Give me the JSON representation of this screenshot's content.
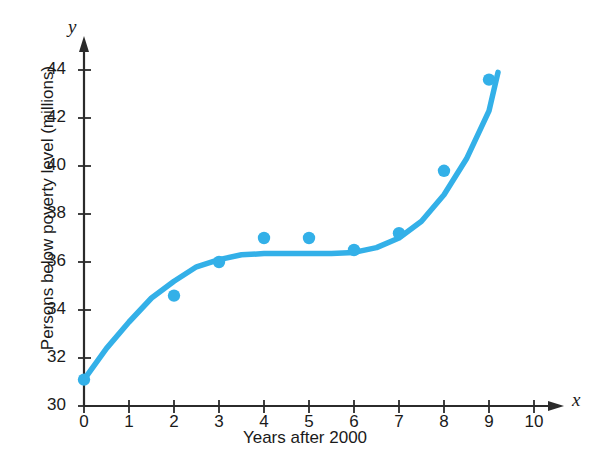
{
  "chart_data": {
    "type": "scatter",
    "title": "",
    "xlabel": "Years after 2000",
    "ylabel": "Persons below poverty level (millions)",
    "x_axis_variable": "x",
    "y_axis_variable": "y",
    "xlim": [
      0,
      10
    ],
    "ylim": [
      30,
      44
    ],
    "xticks": [
      0,
      1,
      2,
      3,
      4,
      5,
      6,
      7,
      8,
      9,
      10
    ],
    "xtick_labels": [
      "0",
      "1",
      "2",
      "3",
      "4",
      "5",
      "6",
      "7",
      "8",
      "9",
      "10"
    ],
    "yticks": [
      30,
      32,
      34,
      36,
      38,
      40,
      42,
      44
    ],
    "ytick_labels": [
      "30",
      "32",
      "34",
      "36",
      "38",
      "40",
      "42",
      "44"
    ],
    "grid": false,
    "legend": false,
    "series": [
      {
        "name": "Persons below poverty level",
        "kind": "scatter",
        "marker_color": "#33b0e8",
        "x": [
          0,
          2,
          3,
          4,
          5,
          6,
          7,
          8,
          9
        ],
        "values": [
          31.1,
          34.6,
          36.0,
          37.0,
          37.0,
          36.5,
          37.2,
          39.8,
          43.6
        ]
      },
      {
        "name": "Fitted curve",
        "kind": "line",
        "line_color": "#33b0e8",
        "x": [
          0,
          0.5,
          1,
          1.5,
          2,
          2.5,
          3,
          3.5,
          4,
          4.5,
          5,
          5.5,
          6,
          6.5,
          7,
          7.5,
          8,
          8.5,
          9,
          9.2
        ],
        "values": [
          31.1,
          32.4,
          33.5,
          34.5,
          35.2,
          35.8,
          36.1,
          36.3,
          36.35,
          36.35,
          36.35,
          36.35,
          36.4,
          36.6,
          37.0,
          37.7,
          38.8,
          40.3,
          42.3,
          43.9
        ]
      }
    ]
  },
  "colors": {
    "accent": "#33b0e8",
    "axis": "#2b2b2b",
    "text": "#1a1a1a"
  }
}
